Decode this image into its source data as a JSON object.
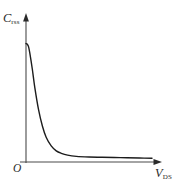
{
  "chart_data": {
    "type": "line",
    "title": "",
    "subtitle": "",
    "xlabel": "V",
    "xlabel_sub": "DS",
    "xlabel_full": "V_DS",
    "ylabel": "C",
    "ylabel_sub": "rss",
    "ylabel_full": "C_rss",
    "origin_label": "O",
    "grid": false,
    "legend": null,
    "axis_ticks": [],
    "tick_labels": [],
    "xlim": [
      0,
      1
    ],
    "ylim": [
      0,
      1
    ],
    "axes_style": "arrow-tipped L-shaped axes, no ticks, no gridlines",
    "series": [
      {
        "name": "Crss vs Vds",
        "color": "#1c1c1c",
        "line_width": 1.4,
        "x": [
          0.0,
          0.01,
          0.02,
          0.03,
          0.05,
          0.07,
          0.1,
          0.13,
          0.16,
          0.2,
          0.24,
          0.28,
          0.33,
          0.4,
          0.5,
          0.6,
          0.7,
          0.8,
          0.9,
          1.0
        ],
        "y": [
          0.955,
          0.95,
          0.93,
          0.88,
          0.75,
          0.6,
          0.42,
          0.29,
          0.2,
          0.13,
          0.09,
          0.07,
          0.055,
          0.045,
          0.04,
          0.038,
          0.036,
          0.034,
          0.032,
          0.03
        ]
      }
    ],
    "annotations": []
  },
  "colors": {
    "background": "#ffffff",
    "curve": "#1c1c1c",
    "axis": "#4a4a4a",
    "label_text": "#2a2a2a"
  }
}
